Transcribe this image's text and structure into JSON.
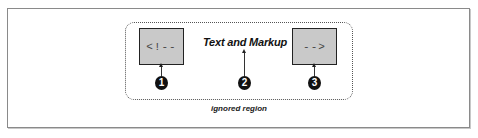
{
  "diagram": {
    "start_marker": "<!--",
    "content_label": "Text and Markup",
    "end_marker": "-->",
    "region_caption": "ignored region",
    "callouts": [
      "1",
      "2",
      "3"
    ]
  }
}
